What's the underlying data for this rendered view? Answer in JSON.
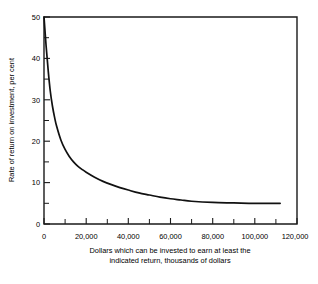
{
  "chart_data": {
    "type": "line",
    "title": "",
    "xlabel": "Dollars which can be invested to earn at least the indicated return, thousands of dollars",
    "xlabel_line1": "Dollars which can be invested to earn at least the",
    "xlabel_line2": "indicated return, thousands of dollars",
    "ylabel": "Rate of return on investment, per cent",
    "xlim": [
      0,
      120000
    ],
    "ylim": [
      0,
      50
    ],
    "grid": false,
    "legend": "none",
    "line_color": "#111111",
    "axis_color": "#1a1a1a",
    "background_color": "#ffffff",
    "x_ticks": [
      0,
      20000,
      40000,
      60000,
      80000,
      100000,
      120000
    ],
    "x_tick_labels": [
      "0",
      "20,000",
      "40,000",
      "60,000",
      "80,000",
      "100,000",
      "120,000"
    ],
    "x_minor_ticks": [
      10000,
      30000,
      50000,
      70000,
      90000,
      110000
    ],
    "y_ticks": [
      0,
      10,
      20,
      30,
      40,
      50
    ],
    "y_tick_labels": [
      "0",
      "10",
      "20",
      "30",
      "40",
      "50"
    ],
    "y_minor_ticks": [
      5,
      15,
      25,
      35,
      45
    ],
    "series": [
      {
        "name": "Rate of return",
        "x": [
          0,
          1000,
          2000,
          3000,
          4000,
          5000,
          6000,
          8000,
          10000,
          12000,
          14000,
          16000,
          18000,
          20000,
          24000,
          28000,
          32000,
          36000,
          40000,
          45000,
          50000,
          55000,
          60000,
          65000,
          70000,
          80000,
          90000,
          100000,
          112000
        ],
        "values": [
          50.0,
          43.0,
          37.0,
          32.0,
          28.5,
          25.8,
          23.6,
          20.3,
          18.0,
          16.3,
          15.0,
          14.0,
          13.2,
          12.5,
          11.3,
          10.3,
          9.5,
          8.8,
          8.2,
          7.5,
          7.0,
          6.5,
          6.1,
          5.8,
          5.5,
          5.2,
          5.1,
          5.0,
          5.0
        ]
      }
    ],
    "asymptote_value": 5.0,
    "curve_start": {
      "x": 0,
      "y": 50
    },
    "curve_end": {
      "x": 112000,
      "y": 5.0
    }
  }
}
